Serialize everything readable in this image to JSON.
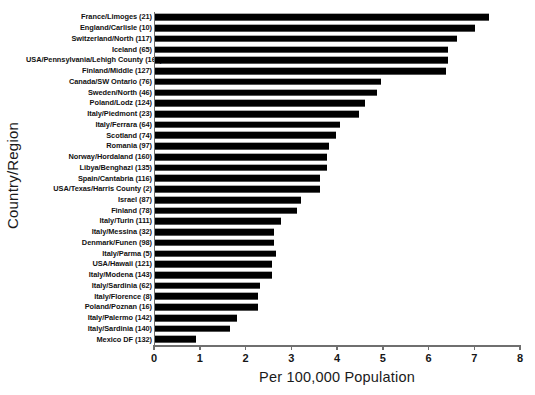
{
  "chart_data": {
    "type": "bar",
    "orientation": "horizontal",
    "title": "",
    "xlabel": "Per 100,000 Population",
    "ylabel": "Country/Region",
    "xlim": [
      0,
      8
    ],
    "xticks": [
      0,
      1,
      2,
      3,
      4,
      5,
      6,
      7,
      8
    ],
    "xtick_labels": [
      "0",
      "1",
      "2",
      "3",
      "4",
      "5",
      "6",
      "7",
      "8"
    ],
    "grid": false,
    "legend": false,
    "bar_color": "#000000",
    "axis_color": "#6f6f6f",
    "categories": [
      "France/Limoges (21)",
      "England/Carlisle (10)",
      "Switzerland/North (117)",
      "Iceland (65)",
      "USA/Pennsylvania/Lehigh County (166)",
      "Finland/Middle (127)",
      "Canada/SW Ontario (76)",
      "Sweden/North (46)",
      "Poland/Lodz (124)",
      "Italy/Piedmont (23)",
      "Italy/Ferrara (64)",
      "Scotland (74)",
      "Romania (97)",
      "Norway/Hordaland (160)",
      "Libya/Benghazi (135)",
      "Spain/Cantabria (116)",
      "USA/Texas/Harris County (2)",
      "Israel (87)",
      "Finland (78)",
      "Italy/Turin (111)",
      "Italy/Messina (32)",
      "Denmark/Funen (98)",
      "Italy/Parma (5)",
      "USA/Hawaii (121)",
      "Italy/Modena (143)",
      "Italy/Sardinia (62)",
      "Italy/Florence (8)",
      "Poland/Poznan (16)",
      "Italy/Palermo (142)",
      "Italy/Sardinia (140)",
      "Mexico DF (132)"
    ],
    "values": [
      7.3,
      7.0,
      6.6,
      6.4,
      6.4,
      6.35,
      4.95,
      4.85,
      4.6,
      4.45,
      4.05,
      3.95,
      3.8,
      3.75,
      3.75,
      3.6,
      3.6,
      3.2,
      3.1,
      2.75,
      2.6,
      2.6,
      2.65,
      2.55,
      2.55,
      2.3,
      2.25,
      2.25,
      1.8,
      1.65,
      0.9
    ]
  }
}
